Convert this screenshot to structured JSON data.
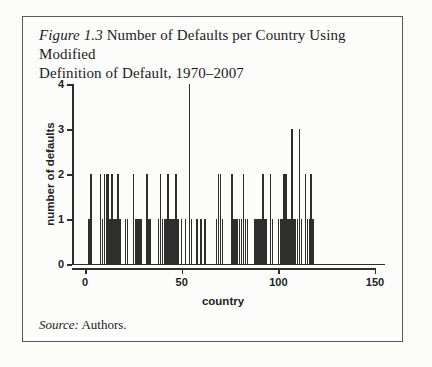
{
  "figure": {
    "title": {
      "prefix": "Figure 1.3",
      "line1_rest": " Number of Defaults per Country Using Modified",
      "line2": "Definition of Default, 1970–2007"
    },
    "source": {
      "prefix": "Source:",
      "text": " Authors."
    }
  },
  "chart_data": {
    "type": "bar",
    "title": "Figure 1.3 Number of Defaults per Country Using Modified Definition of Default, 1970–2007",
    "xlabel": "country",
    "ylabel": "number of defaults",
    "xlim": [
      0,
      155
    ],
    "ylim": [
      0,
      4
    ],
    "x_ticks": [
      0,
      50,
      100,
      150
    ],
    "y_ticks": [
      0,
      1,
      2,
      3,
      4
    ],
    "grid": false,
    "legend": "none",
    "bar_color": "#2e2e2e",
    "axis_color": "#2d2d2d",
    "x": [
      2,
      3,
      8,
      9,
      10,
      11,
      12,
      13,
      14,
      15,
      16,
      17,
      18,
      21,
      22,
      25,
      26,
      27,
      28,
      29,
      32,
      33,
      34,
      38,
      39,
      40,
      41,
      42,
      43,
      44,
      45,
      46,
      47,
      48,
      50,
      52,
      54,
      55,
      58,
      60,
      62,
      68,
      69,
      70,
      71,
      76,
      77,
      78,
      79,
      80,
      81,
      82,
      83,
      84,
      88,
      89,
      90,
      91,
      92,
      93,
      94,
      96,
      97,
      100,
      101,
      102,
      103,
      104,
      105,
      106,
      107,
      108,
      109,
      110,
      111,
      112,
      114,
      115,
      116,
      117,
      118
    ],
    "values": [
      1,
      2,
      2,
      1,
      2,
      2,
      2,
      1,
      2,
      1,
      1,
      2,
      1,
      1,
      1,
      2,
      1,
      1,
      1,
      1,
      2,
      1,
      1,
      1,
      2,
      1,
      1,
      1,
      2,
      1,
      1,
      1,
      2,
      1,
      1,
      1,
      4,
      1,
      1,
      1,
      1,
      1,
      2,
      2,
      1,
      2,
      1,
      1,
      1,
      1,
      1,
      2,
      1,
      1,
      1,
      1,
      1,
      1,
      2,
      1,
      1,
      2,
      1,
      1,
      1,
      1,
      2,
      2,
      1,
      1,
      3,
      1,
      1,
      1,
      3,
      1,
      2,
      1,
      1,
      2,
      1
    ]
  }
}
